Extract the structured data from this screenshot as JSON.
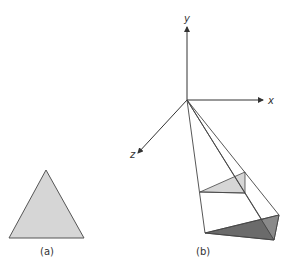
{
  "figure": {
    "panel_a": {
      "label": "(a)",
      "fill": "#d6d6d6",
      "stroke": "#555555"
    },
    "panel_b": {
      "label": "(b)",
      "axes": {
        "x": "x",
        "y": "y",
        "z": "z"
      },
      "near_triangle_fill": "#d6d6d6",
      "far_triangle_fill": "#6b6b6b",
      "far_triangle_light_fill": "#8a8a8a",
      "line_color": "#444444"
    }
  }
}
